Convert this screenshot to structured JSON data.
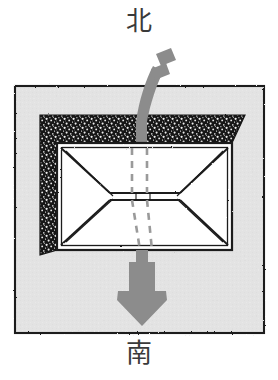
{
  "figure": {
    "title_north": "北",
    "title_south": "南",
    "caption_partial": ""
  },
  "labels": {
    "north": "北",
    "south": "南"
  },
  "colors": {
    "page_background": "#ffffff",
    "frame_fill": "#e3e3e3",
    "frame_stroke": "#1a1a1a",
    "roof_fill": "#ffffff",
    "roof_stroke": "#1a1a1a",
    "hatch_dark": "#161616",
    "hatch_speck": "#f2f2f2",
    "arrow_gray": "#8c8c8c",
    "dashed_line": "#9a9a9a",
    "text_gray": "#3a3a3a"
  },
  "geometry": {
    "frame": {
      "x": 15,
      "y": 86,
      "width": 249,
      "height": 247
    },
    "roof": {
      "x": 57,
      "y": 143,
      "width": 175,
      "height": 107
    },
    "ridge": {
      "x1": 110,
      "y1": 196,
      "x2": 180,
      "y2": 196
    },
    "shadow_band_top": {
      "x": 40,
      "y": 115,
      "width": 205,
      "height": 28
    },
    "shadow_band_left": {
      "x": 40,
      "y": 115,
      "width": 17,
      "height": 140
    }
  },
  "arrow": {
    "label_from": "北",
    "label_to": "南",
    "direction": "north-to-south",
    "tail_dashes": 2,
    "head_shape": "chevron-down"
  },
  "dashed_lines": {
    "count": 2,
    "orientation": "vertical",
    "note": "airflow trace lines through roof"
  }
}
